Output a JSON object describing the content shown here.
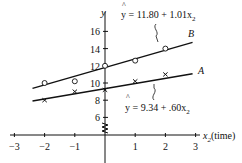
{
  "chart_data": {
    "type": "scatter",
    "title": "",
    "xlabel": "x2 (time)",
    "ylabel": "y",
    "xlim": [
      -3,
      3
    ],
    "ylim": [
      4,
      17
    ],
    "x_ticks": [
      "-3",
      "-2",
      "-1",
      "1",
      "2",
      "3"
    ],
    "y_ticks": [
      "6",
      "8",
      "10",
      "12",
      "14",
      "16"
    ],
    "grid": false,
    "series": [
      {
        "name": "B",
        "marker": "circle",
        "x": [
          -2,
          -1,
          0,
          1,
          2
        ],
        "y": [
          10.0,
          10.2,
          12.0,
          12.6,
          14.0
        ],
        "fit": {
          "intercept": 11.8,
          "slope": 1.01,
          "label": "ŷ = 11.80 + 1.01x2"
        }
      },
      {
        "name": "A",
        "marker": "x",
        "x": [
          -2,
          -1,
          0,
          1,
          2
        ],
        "y": [
          8.0,
          9.0,
          9.2,
          10.2,
          11.0
        ],
        "fit": {
          "intercept": 9.34,
          "slope": 0.6,
          "label": "ŷ = 9.34 + .60x2"
        }
      }
    ],
    "annotations": [
      "axis break on y-axis near y=5"
    ]
  },
  "labels": {
    "y_axis": "y",
    "x_axis": "x",
    "x_axis_sub": "2",
    "x_axis_suffix": "(time)",
    "line_b": "B",
    "line_a": "A",
    "eq_b_main": "y = 11.80 + 1.01x",
    "eq_b_sub": "2",
    "eq_a_main": "y = 9.34 + .60x",
    "eq_a_sub": "2",
    "hat": "^"
  }
}
